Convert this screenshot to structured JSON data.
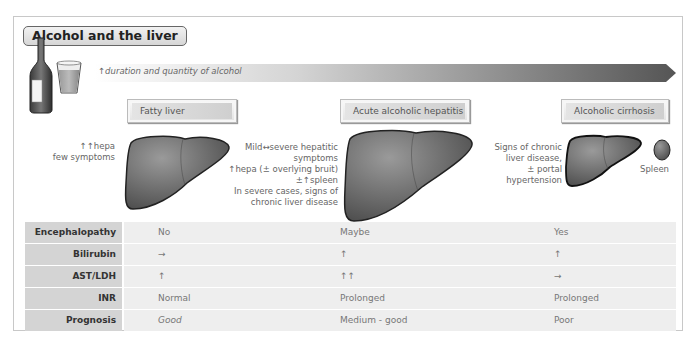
{
  "title": "Alcohol and the liver",
  "arrow": {
    "label": "↑duration and quantity of alcohol",
    "gradient_start": "#ffffff",
    "gradient_end": "#555555"
  },
  "stages": [
    {
      "name": "Fatty liver",
      "notes": [
        "↑↑hepa",
        "few symptoms"
      ]
    },
    {
      "name": "Acute alcoholic hepatitis",
      "notes": [
        "Mild↔severe hepatitic",
        "symptoms",
        "↑hepa (± overlying bruit)",
        "±↑spleen",
        "In severe cases, signs of",
        "chronic liver disease"
      ]
    },
    {
      "name": "Alcoholic cirrhosis",
      "notes": [
        "Signs of chronic",
        "liver disease,",
        "± portal",
        "hypertension"
      ],
      "extra_label": "Spleen"
    }
  ],
  "table": {
    "rows": [
      {
        "label": "Encephalopathy",
        "values": [
          "No",
          "Maybe",
          "Yes"
        ]
      },
      {
        "label": "Bilirubin",
        "values": [
          "→",
          "↑",
          "↑"
        ]
      },
      {
        "label": "AST/LDH",
        "values": [
          "↑",
          "↑↑",
          "→"
        ]
      },
      {
        "label": "INR",
        "values": [
          "Normal",
          "Prolonged",
          "Prolonged"
        ]
      },
      {
        "label": "Prognosis",
        "values": [
          "Good",
          "Medium - good",
          "Poor"
        ]
      }
    ]
  },
  "colors": {
    "label_bg": "#d4d4d4",
    "cell_bg": "#eeeeee",
    "liver": "#6e6e6e"
  }
}
